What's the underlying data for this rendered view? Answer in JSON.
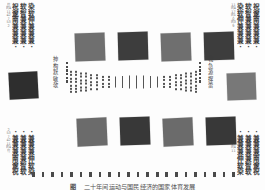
{
  "figure": {
    "background_color": "#fdfdfd",
    "caption": {
      "number": "图",
      "text": "二十年间运动与国民经济的国家体育发展"
    }
  },
  "corner_labels": {
    "top_left": {
      "position": "top-left",
      "columns": [
        {
          "size": "big",
          "chars": [
            "染",
            "软",
            "伸",
            "兼",
            "兼",
            "兼",
            "·"
          ]
        },
        {
          "size": "big",
          "chars": [
            "软",
            "智",
            "兼",
            "兼",
            "兼",
            "兼",
            "·"
          ]
        },
        {
          "size": "big",
          "chars": [
            "祝",
            "邃",
            "南",
            "兼",
            "兼",
            "兼",
            "·"
          ]
        },
        {
          "size": "tiny",
          "chars": [
            "竹",
            "的4",
            "11",
            "42",
            "7",
            "53",
            "2"
          ]
        }
      ]
    },
    "top_right": {
      "position": "top-right",
      "columns": [
        {
          "size": "tiny",
          "chars": [
            "11",
            "的4",
            "17",
            "的1",
            "0",
            "的3",
            "9"
          ]
        },
        {
          "size": "big",
          "chars": [
            "染",
            "软",
            "伸",
            "兼",
            "兼",
            "兼",
            "·"
          ]
        },
        {
          "size": "big",
          "chars": [
            "软",
            "智",
            "兼",
            "兼",
            "兼",
            "兼",
            "·"
          ]
        },
        {
          "size": "big",
          "chars": [
            "祝",
            "邃",
            "南",
            "兼",
            "兼",
            "兼",
            "·"
          ]
        }
      ]
    },
    "bottom_left": {
      "position": "bottom-left",
      "columns": [
        {
          "size": "big",
          "chars": [
            "·",
            "兼",
            "兼",
            "兼",
            "伸",
            "软",
            "染"
          ]
        },
        {
          "size": "big",
          "chars": [
            "·",
            "兼",
            "兼",
            "兼",
            "兼",
            "智",
            "软"
          ]
        },
        {
          "size": "big",
          "chars": [
            "·",
            "兼",
            "兼",
            "兼",
            "南",
            "邃",
            "祝"
          ]
        },
        {
          "size": "tiny",
          "chars": [
            "2",
            "53",
            "7",
            "42",
            "11",
            "的4",
            "竹"
          ]
        }
      ]
    },
    "bottom_right": {
      "position": "bottom-right",
      "columns": [
        {
          "size": "tiny",
          "chars": [
            "9",
            "的3",
            "0",
            "的1",
            "17",
            "的4",
            "11"
          ]
        },
        {
          "size": "big",
          "chars": [
            "·",
            "兼",
            "兼",
            "兼",
            "伸",
            "软",
            "染"
          ]
        },
        {
          "size": "big",
          "chars": [
            "·",
            "兼",
            "兼",
            "兼",
            "兼",
            "智",
            "软"
          ]
        },
        {
          "size": "big",
          "chars": [
            "·",
            "兼",
            "兼",
            "兼",
            "南",
            "邃",
            "祝"
          ]
        }
      ]
    }
  },
  "axis_labels": {
    "left": {
      "chars": [
        "抻",
        "构",
        "默",
        "敏",
        "欹"
      ]
    },
    "right": {
      "chars": [
        "戦",
        "急",
        "源",
        "撺",
        "蕾"
      ]
    }
  },
  "dot_ladders": {
    "left": {
      "count": 6
    },
    "right": {
      "count": 6
    }
  },
  "squares": [
    {
      "name": "top-row-square-1",
      "x": 75,
      "y": 33,
      "w": 30,
      "h": 28,
      "color": "#6f6f6f",
      "rotate": -2.0
    },
    {
      "name": "top-row-square-2",
      "x": 118,
      "y": 32,
      "w": 30,
      "h": 28,
      "color": "#3d3d3d",
      "rotate": -1.5
    },
    {
      "name": "top-row-square-3",
      "x": 161,
      "y": 33,
      "w": 30,
      "h": 28,
      "color": "#6f6f6f",
      "rotate": -2.0
    },
    {
      "name": "top-row-square-4",
      "x": 204,
      "y": 32,
      "w": 30,
      "h": 28,
      "color": "#3d3d3d",
      "rotate": -1.5
    },
    {
      "name": "left-side-square",
      "x": 9,
      "y": 72,
      "w": 29,
      "h": 27,
      "color": "#2e2e2e",
      "rotate": -3.0
    },
    {
      "name": "right-side-square",
      "x": 227,
      "y": 73,
      "w": 29,
      "h": 27,
      "color": "#787878",
      "rotate": -2.0
    },
    {
      "name": "bottom-row-square-1",
      "x": 77,
      "y": 118,
      "w": 30,
      "h": 28,
      "color": "#6b6b6b",
      "rotate": -2.5
    },
    {
      "name": "bottom-row-square-2",
      "x": 120,
      "y": 117,
      "w": 30,
      "h": 28,
      "color": "#383838",
      "rotate": -2.0
    },
    {
      "name": "bottom-row-square-3",
      "x": 163,
      "y": 118,
      "w": 30,
      "h": 28,
      "color": "#6b6b6b",
      "rotate": -2.5
    },
    {
      "name": "bottom-row-square-4",
      "x": 206,
      "y": 117,
      "w": 30,
      "h": 28,
      "color": "#383838",
      "rotate": -2.0
    }
  ],
  "lens_field": {
    "description": "symmetric lens/hourglass field of vertical tick columns, dense dotted at edges, solid tall lines in middle",
    "columns": [
      {
        "x": 0,
        "mode": "dots",
        "ticks": 7,
        "len": 2.0
      },
      {
        "x": 5,
        "mode": "dots",
        "ticks": 7,
        "len": 2.0
      },
      {
        "x": 10,
        "mode": "dots",
        "ticks": 6,
        "len": 2.0
      },
      {
        "x": 15,
        "mode": "dots",
        "ticks": 6,
        "len": 2.0
      },
      {
        "x": 20,
        "mode": "dots",
        "ticks": 5,
        "len": 2.0
      },
      {
        "x": 26,
        "mode": "dots",
        "ticks": 5,
        "len": 2.0
      },
      {
        "x": 32,
        "mode": "dots",
        "ticks": 4,
        "len": 2.0
      },
      {
        "x": 38,
        "mode": "dots",
        "ticks": 4,
        "len": 2.0
      },
      {
        "x": 45,
        "mode": "line",
        "ticks": 1,
        "len": 11.0
      },
      {
        "x": 52,
        "mode": "line",
        "ticks": 1,
        "len": 12.0
      },
      {
        "x": 59,
        "mode": "line",
        "ticks": 1,
        "len": 13.0
      },
      {
        "x": 66,
        "mode": "line",
        "ticks": 1,
        "len": 13.0
      },
      {
        "x": 73,
        "mode": "line",
        "ticks": 1,
        "len": 13.0
      },
      {
        "x": 80,
        "mode": "line",
        "ticks": 1,
        "len": 12.0
      },
      {
        "x": 87,
        "mode": "line",
        "ticks": 1,
        "len": 11.0
      },
      {
        "x": 93,
        "mode": "dots",
        "ticks": 4,
        "len": 2.0
      },
      {
        "x": 99,
        "mode": "dots",
        "ticks": 4,
        "len": 2.0
      },
      {
        "x": 105,
        "mode": "dots",
        "ticks": 5,
        "len": 2.0
      },
      {
        "x": 110,
        "mode": "dots",
        "ticks": 5,
        "len": 2.0
      },
      {
        "x": 115,
        "mode": "dots",
        "ticks": 6,
        "len": 2.0
      },
      {
        "x": 120,
        "mode": "dots",
        "ticks": 6,
        "len": 2.0
      },
      {
        "x": 125,
        "mode": "dots",
        "ticks": 7,
        "len": 2.0
      }
    ]
  },
  "bottom_strip": {
    "tick_count": 22
  }
}
